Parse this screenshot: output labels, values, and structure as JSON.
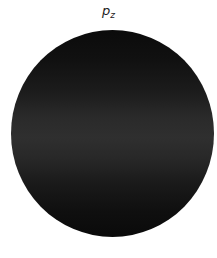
{
  "figure": {
    "label_main": "p",
    "label_sub": "z",
    "orbital_colors": {
      "edge": "#0b0b0b",
      "center_band": "#2f2f2f"
    },
    "background": "#ffffff"
  }
}
